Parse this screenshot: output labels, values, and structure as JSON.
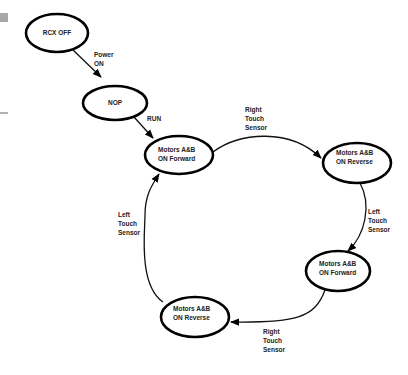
{
  "diagram": {
    "type": "state-diagram",
    "colors": {
      "stroke": "#000000",
      "text": "#222222",
      "background": "#ffffff",
      "margin_block": "#a8a8a8"
    },
    "nodes": [
      {
        "id": "rcx-off",
        "lines": [
          "RCX OFF"
        ],
        "cx": 57,
        "cy": 33,
        "rx": 31,
        "ry": 19
      },
      {
        "id": "nop",
        "lines": [
          "NOP"
        ],
        "cx": 115,
        "cy": 103,
        "rx": 32,
        "ry": 17
      },
      {
        "id": "fwd-1",
        "lines": [
          "Motors A&B",
          "ON Forward"
        ],
        "cx": 179,
        "cy": 155,
        "rx": 34,
        "ry": 19
      },
      {
        "id": "rev-1",
        "lines": [
          "Motors A&B",
          "ON Reverse"
        ],
        "cx": 357,
        "cy": 163,
        "rx": 34,
        "ry": 20
      },
      {
        "id": "fwd-2",
        "lines": [
          "Motors A&B",
          "ON Forward"
        ],
        "cx": 338,
        "cy": 271,
        "rx": 32,
        "ry": 20
      },
      {
        "id": "rev-2",
        "lines": [
          "Motors A&B",
          "ON Reverse"
        ],
        "cx": 195,
        "cy": 317,
        "rx": 34,
        "ry": 20
      }
    ],
    "edges": [
      {
        "from": "rcx-off",
        "to": "nop",
        "label": [
          "Power",
          "ON"
        ],
        "label_x": 94,
        "label_y": 56
      },
      {
        "from": "nop",
        "to": "fwd-1",
        "label": [
          "RUN"
        ],
        "label_x": 147,
        "label_y": 121
      },
      {
        "from": "fwd-1",
        "to": "rev-1",
        "label": [
          "Right",
          "Touch",
          "Sensor"
        ],
        "label_x": 245,
        "label_y": 110
      },
      {
        "from": "rev-1",
        "to": "fwd-2",
        "label": [
          "Left",
          "Touch",
          "Sensor"
        ],
        "label_x": 368,
        "label_y": 213
      },
      {
        "from": "fwd-2",
        "to": "rev-2",
        "label": [
          "Right",
          "Touch",
          "Sensor"
        ],
        "label_x": 263,
        "label_y": 334
      },
      {
        "from": "rev-2",
        "to": "fwd-1",
        "label": [
          "Left",
          "Touch",
          "Sensor"
        ],
        "label_x": 118,
        "label_y": 217
      }
    ]
  },
  "labels": {
    "rcx_off": "RCX OFF",
    "nop": "NOP",
    "motors_ab": "Motors A&B",
    "on_forward": "ON Forward",
    "on_reverse": "ON Reverse",
    "power": "Power",
    "on": "ON",
    "run": "RUN",
    "right": "Right",
    "left": "Left",
    "touch": "Touch",
    "sensor": "Sensor"
  }
}
